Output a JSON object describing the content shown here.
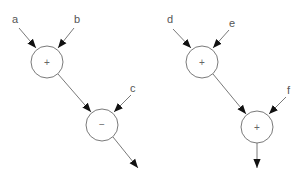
{
  "diagrams": [
    {
      "name": "expression-tree-left",
      "inputs": [
        "a",
        "b",
        "c"
      ],
      "nodes": [
        {
          "id": "n1",
          "op": "+",
          "inputs": [
            "a",
            "b"
          ]
        },
        {
          "id": "n2",
          "op": "−",
          "inputs": [
            "n1",
            "c"
          ]
        }
      ],
      "output_from": "n2"
    },
    {
      "name": "expression-tree-right",
      "inputs": [
        "d",
        "e",
        "f"
      ],
      "nodes": [
        {
          "id": "n3",
          "op": "+",
          "inputs": [
            "d",
            "e"
          ]
        },
        {
          "id": "n4",
          "op": "+",
          "inputs": [
            "n3",
            "f"
          ]
        }
      ],
      "output_from": "n4"
    }
  ],
  "labels": {
    "a": "a",
    "b": "b",
    "c": "c",
    "d": "d",
    "e": "e",
    "f": "f",
    "op1": "+",
    "op2": "−",
    "op3": "+",
    "op4": "+"
  },
  "colors": {
    "stroke": "#7a7a7a",
    "arrow": "#111111",
    "text": "#555555"
  }
}
